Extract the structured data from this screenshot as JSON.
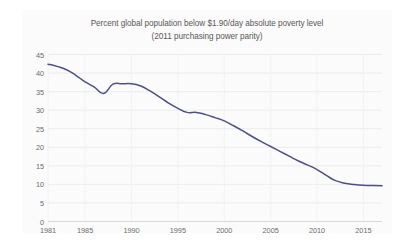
{
  "chart_data": {
    "type": "line",
    "title": "Percent global population below $1.90/day absolute poverty level\n(2011 purchasing power parity)",
    "title_line1": "Percent global population below $1.90/day absolute poverty level",
    "title_line2": "(2011 purchasing power parity)",
    "xlabel": "",
    "ylabel": "",
    "ylim": [
      0,
      45
    ],
    "xlim": [
      1981,
      2017
    ],
    "grid": true,
    "legend": "none",
    "y_ticks": [
      0,
      5,
      10,
      15,
      20,
      25,
      30,
      35,
      40,
      45
    ],
    "x_ticks": [
      1981,
      1985,
      1990,
      1995,
      2000,
      2005,
      2010,
      2015
    ],
    "line_color": "#4a5288",
    "series": [
      {
        "name": "Percent global population below $1.90/day",
        "x": [
          1981,
          1982,
          1983,
          1984,
          1985,
          1986,
          1987,
          1988,
          1989,
          1990,
          1991,
          1992,
          1993,
          1994,
          1995,
          1996,
          1997,
          1998,
          1999,
          2000,
          2001,
          2002,
          2003,
          2004,
          2005,
          2006,
          2007,
          2008,
          2009,
          2010,
          2011,
          2012,
          2013,
          2014,
          2015,
          2016,
          2017
        ],
        "values": [
          42.4,
          41.8,
          40.9,
          39.4,
          37.6,
          36.2,
          34.5,
          37.0,
          37.1,
          37.1,
          36.5,
          35.2,
          33.6,
          31.9,
          30.5,
          29.4,
          29.4,
          28.8,
          28.0,
          27.1,
          25.8,
          24.4,
          22.9,
          21.5,
          20.2,
          18.9,
          17.6,
          16.3,
          15.2,
          14.0,
          12.4,
          11.0,
          10.3,
          10.0,
          9.8,
          9.7,
          9.6
        ]
      }
    ]
  }
}
